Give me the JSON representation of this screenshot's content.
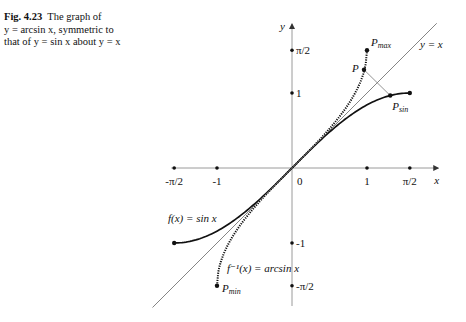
{
  "caption": {
    "figure_label": "Fig. 4.23",
    "text_line1": "The graph of",
    "text_line2": "y = arcsin x, symmetric to",
    "text_line3": "that of y = sin x about y = x"
  },
  "chart_data": {
    "type": "line",
    "title": "The graph of y = arcsin x, symmetric to that of y = sin x about y = x",
    "xlabel": "x",
    "ylabel": "y",
    "xlim": [
      -1.61,
      1.95
    ],
    "ylim": [
      -1.84,
      1.92
    ],
    "grid": false,
    "x_ticks": [
      {
        "value": -1.5708,
        "label": "-π/2"
      },
      {
        "value": -1,
        "label": "-1"
      },
      {
        "value": 1,
        "label": "1"
      },
      {
        "value": 1.5708,
        "label": "π/2"
      }
    ],
    "y_ticks": [
      {
        "value": 1.5708,
        "label": "π/2"
      },
      {
        "value": 1,
        "label": "1"
      },
      {
        "value": -1,
        "label": "-1"
      },
      {
        "value": -1.5708,
        "label": "-π/2"
      }
    ],
    "origin_label": "0",
    "series": [
      {
        "name": "f(x) = sin x",
        "style": "solid-thick",
        "domain": [
          -1.5708,
          1.5708
        ],
        "function": "sin"
      },
      {
        "name": "f⁻¹(x) = arcsin x",
        "style": "dotted-thick",
        "domain": [
          -1,
          1
        ],
        "function": "arcsin"
      },
      {
        "name": "y = x",
        "style": "thin",
        "x": [
          -1.86,
          1.93
        ],
        "y": [
          -1.86,
          1.93
        ]
      }
    ],
    "points": [
      {
        "name": "P_max",
        "x": 1,
        "y": 1.5708
      },
      {
        "name": "P",
        "x": 0.96,
        "y": 1.31
      },
      {
        "name": "P_sin",
        "x": 1.31,
        "y": 0.966
      },
      {
        "name": "P_min",
        "x": -1,
        "y": -1.5708
      },
      {
        "name": "sin_end_right",
        "x": 1.5708,
        "y": 1
      },
      {
        "name": "sin_end_left",
        "x": -1.5708,
        "y": -1
      }
    ],
    "annotations": [
      {
        "text": "P_max",
        "near": "P_max"
      },
      {
        "text": "P",
        "near": "P"
      },
      {
        "text": "P_sin",
        "near": "P_sin"
      },
      {
        "text": "P_min",
        "near": "P_min"
      },
      {
        "text": "y = x",
        "near": "line y=x upper right"
      },
      {
        "text": "f(x) = sin x",
        "near": "sin curve lower left"
      },
      {
        "text": "f⁻¹(x) = arcsin x",
        "near": "arcsin curve lower"
      }
    ]
  }
}
